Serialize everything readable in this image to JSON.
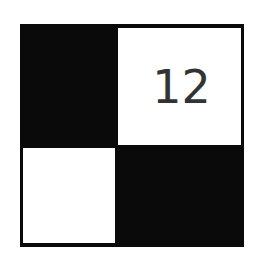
{
  "puzzle": {
    "rows": 2,
    "cols": 2,
    "cells": [
      {
        "row": 0,
        "col": 0,
        "fill": "black",
        "number": ""
      },
      {
        "row": 0,
        "col": 1,
        "fill": "white",
        "number": "12"
      },
      {
        "row": 1,
        "col": 0,
        "fill": "white",
        "number": ""
      },
      {
        "row": 1,
        "col": 1,
        "fill": "black",
        "number": ""
      }
    ]
  },
  "colors": {
    "black": "#0a0a0a",
    "white": "#ffffff",
    "text": "#333333"
  }
}
